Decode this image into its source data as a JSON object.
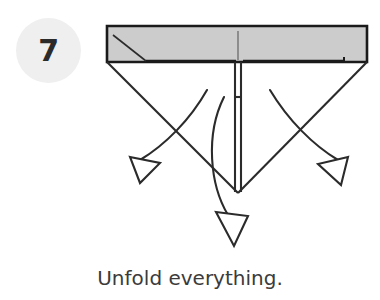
{
  "page": {
    "background_color": "#ffffff",
    "width": 380,
    "height": 300
  },
  "step": {
    "number": "7",
    "badge_bg_color": "#efefef",
    "number_color": "#2b2b2b"
  },
  "caption": {
    "text": "Unfold everything.",
    "color": "#3b3b3b"
  },
  "diagram": {
    "type": "origami-fold-instruction",
    "line_color": "#2b2b2b",
    "paper_fill_color": "#cccccc",
    "paper_edge_color": "#1a1a1a",
    "shapes": {
      "top_band": {
        "name": "folded-paper-band",
        "points": "107,26 367,26 367,62 107,62",
        "fill": "#cccccc",
        "stroke": "#1a1a1a",
        "stroke_width": 2.6
      },
      "left_crease_diagonal": {
        "name": "left-crease-line",
        "from": [
          113,
          35
        ],
        "to": [
          146,
          61
        ]
      },
      "inner_left_edge": {
        "name": "inner-left-flap-edge",
        "from": [
          146,
          61
        ],
        "to": [
          236,
          61
        ]
      },
      "inner_right_edge": {
        "name": "inner-right-flap-edge",
        "from": [
          243,
          61
        ],
        "to": [
          344,
          61
        ]
      },
      "right_step_edge": {
        "name": "right-flap-step-edge",
        "from": [
          344,
          61
        ],
        "to": [
          344,
          57
        ]
      },
      "center_crease_top": {
        "name": "center-crease-line",
        "from": [
          238,
          31
        ],
        "to": [
          238,
          60
        ]
      },
      "v_left_arm": {
        "name": "v-fold-left-arm",
        "from": [
          107,
          62
        ],
        "to": [
          238,
          193
        ]
      },
      "v_right_arm": {
        "name": "v-fold-right-arm",
        "from": [
          367,
          62
        ],
        "to": [
          238,
          193
        ]
      },
      "center_strip_left": {
        "name": "center-strip-left-edge",
        "from": [
          235,
          62
        ],
        "to": [
          235,
          192
        ]
      },
      "center_strip_right": {
        "name": "center-strip-right-edge",
        "from": [
          241,
          62
        ],
        "to": [
          241,
          192
        ]
      },
      "center_strip_tick": {
        "name": "center-strip-tick",
        "from": [
          235,
          97
        ],
        "to": [
          241,
          97
        ]
      }
    },
    "arrows": [
      {
        "name": "unfold-arrow-left",
        "direction": "down-left",
        "shaft_path": "M 207,90 C 190,120 165,145 140,160",
        "head_points": "130,157 160,163 140,183"
      },
      {
        "name": "unfold-arrow-right",
        "direction": "down-right",
        "shaft_path": "M 270,90 C 288,120 313,145 338,160",
        "head_points": "348,157 318,164 341,185"
      },
      {
        "name": "unfold-arrow-down",
        "direction": "down",
        "shaft_path": "M 224,97 C 205,135 210,185 228,215",
        "head_points": "216,212 248,216 234,246"
      }
    ]
  }
}
